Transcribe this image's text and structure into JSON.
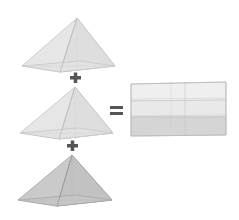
{
  "diagram": {
    "colors": {
      "background": "#ffffff",
      "pyramid_light_face": "#e6e6e6",
      "pyramid_light_edge": "#bdbdbd",
      "pyramid_dark_face": "#c9c9c9",
      "pyramid_dark_edge": "#9a9a9a",
      "box_top_layer": "#eeeeee",
      "box_middle_layer": "#e8e8e8",
      "box_bottom_layer": "#d3d3d3",
      "box_edge": "#bcbcbc",
      "operator": "#555555"
    },
    "operators": {
      "plus_1": "+",
      "plus_2": "+",
      "equals": "="
    },
    "pyramids": [
      {
        "id": "pyramid-1",
        "shade": "light"
      },
      {
        "id": "pyramid-2",
        "shade": "light"
      },
      {
        "id": "pyramid-3",
        "shade": "dark"
      }
    ],
    "prism": {
      "layers": 3
    }
  }
}
